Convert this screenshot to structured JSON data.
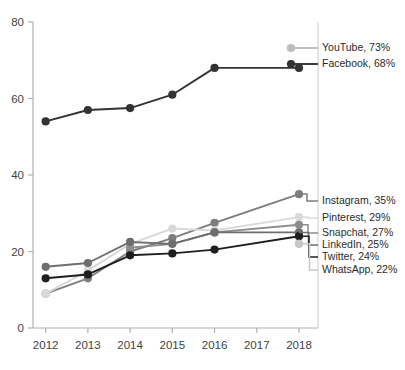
{
  "chart_data": {
    "type": "line",
    "title": "",
    "xlabel": "",
    "ylabel": "",
    "x": [
      2012,
      2013,
      2014,
      2015,
      2016,
      2018
    ],
    "tick_labels_x": [
      "2012",
      "2013",
      "2014",
      "2015",
      "2016",
      "2017",
      "2018"
    ],
    "tick_values_y": [
      0,
      20,
      40,
      60,
      80
    ],
    "tick_labels_y": [
      "0",
      "20",
      "40",
      "60",
      "80"
    ],
    "ylim": [
      0,
      80
    ],
    "xlim": [
      2011.7,
      2018.45
    ],
    "grid": false,
    "legend_position": "right-outside",
    "series": [
      {
        "name": "YouTube",
        "label": "YouTube, 73%",
        "final_value": 73,
        "color": "#bdbdbd",
        "x": [],
        "values": []
      },
      {
        "name": "Facebook",
        "label": "Facebook, 68%",
        "final_value": 68,
        "color": "#333333",
        "x": [
          2012,
          2013,
          2014,
          2015,
          2016,
          2018
        ],
        "values": [
          54,
          57,
          57.5,
          61,
          68,
          68
        ]
      },
      {
        "name": "Instagram",
        "label": "Instagram, 35%",
        "final_value": 35,
        "color": "#7d7d7d",
        "x": [
          2012,
          2013,
          2014,
          2015,
          2016,
          2018
        ],
        "values": [
          9,
          13,
          20,
          23.5,
          27.5,
          35
        ]
      },
      {
        "name": "Pinterest",
        "label": "Pinterest, 29%",
        "final_value": 29,
        "color": "#d9d9d9",
        "x": [
          2012,
          2013,
          2014,
          2015,
          2016,
          2018
        ],
        "values": [
          9,
          15,
          22,
          26,
          25.5,
          29
        ]
      },
      {
        "name": "Snapchat",
        "label": "Snapchat, 27%",
        "final_value": 27,
        "color": "#8c8c8c",
        "x": [
          2014,
          2015,
          2016,
          2018
        ],
        "values": [
          21,
          22,
          25,
          27
        ]
      },
      {
        "name": "LinkedIn",
        "label": "LinkedIn, 25%",
        "final_value": 25,
        "color": "#6e6e6e",
        "x": [
          2012,
          2013,
          2014,
          2015,
          2016,
          2018
        ],
        "values": [
          16,
          17,
          22.5,
          22,
          25,
          25
        ]
      },
      {
        "name": "Twitter",
        "label": "Twitter, 24%",
        "final_value": 24,
        "color": "#1f1f1f",
        "x": [
          2012,
          2013,
          2014,
          2015,
          2016,
          2018
        ],
        "values": [
          13,
          14,
          19,
          19.5,
          20.5,
          24
        ]
      },
      {
        "name": "WhatsApp",
        "label": "WhatsApp, 22%",
        "final_value": 22,
        "color": "#c7c7c7",
        "x": [
          2018
        ],
        "values": [
          22
        ]
      }
    ],
    "legend_entries_top": [
      "YouTube, 73%",
      "Facebook, 68%"
    ],
    "legend_entries_bottom": [
      "Instagram, 35%",
      "Pinterest, 29%",
      "Snapchat, 27%",
      "LinkedIn, 25%",
      "Twitter, 24%",
      "WhatsApp, 22%"
    ]
  },
  "axis": {
    "axis_color": "#b0b0b0",
    "tick_color": "#b0b0b0"
  }
}
